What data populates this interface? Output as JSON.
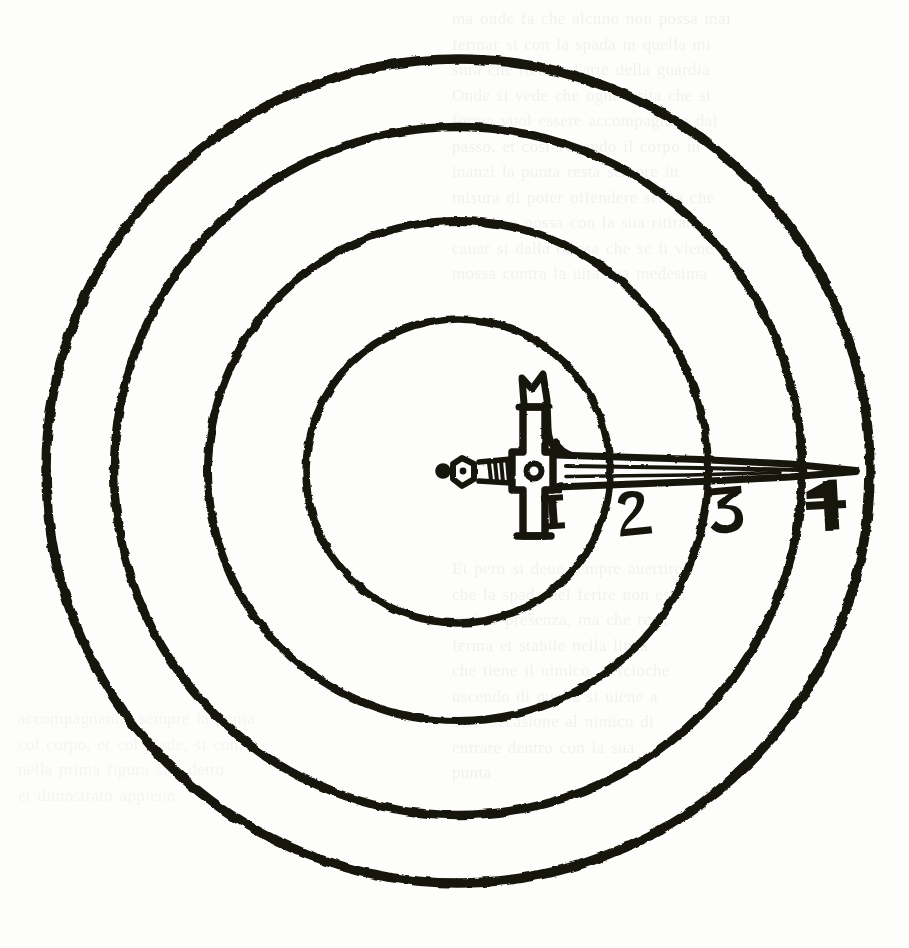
{
  "document": {
    "kind": "engraved plate",
    "caption": "Concentric measure-of-distance diagram with a cruciform sword",
    "background_color": "#fdfdfc",
    "ink_color": "#17150f"
  },
  "plate": {
    "center": {
      "x": 458,
      "y": 471
    },
    "rings": [
      {
        "id": "ring-4",
        "label": "4",
        "radius": 412,
        "stroke": 9.5
      },
      {
        "id": "ring-3",
        "label": "3",
        "radius": 344,
        "stroke": 8.5
      },
      {
        "id": "ring-2",
        "label": "2",
        "radius": 250,
        "stroke": 8.0
      },
      {
        "id": "ring-1",
        "label": "1",
        "radius": 152,
        "stroke": 7.5
      }
    ],
    "zone_numerals": [
      {
        "id": "numeral-1",
        "text": "1",
        "x": 553,
        "y": 512,
        "rotation": -4,
        "size": 40
      },
      {
        "id": "numeral-2",
        "text": "2",
        "x": 634,
        "y": 513,
        "rotation": -6,
        "size": 44
      },
      {
        "id": "numeral-3",
        "text": "3",
        "x": 727,
        "y": 509,
        "rotation": -5,
        "size": 46
      },
      {
        "id": "numeral-4",
        "text": "4",
        "x": 826,
        "y": 505,
        "rotation": -3,
        "size": 50
      }
    ],
    "sword": {
      "name": "cruciform sword",
      "pommel_x": 445,
      "guard_x": 541,
      "tip_x": 858,
      "axis_y": 471,
      "parts": [
        "pommel",
        "grip",
        "cross-guard",
        "side-hook",
        "ricasso",
        "fuller",
        "blade",
        "point"
      ]
    },
    "ghost_text": {
      "note": "illegible show-through from the reverse of the leaf",
      "block_top": "ma onde fa che alcuno non possa mai\nfermar si con la spada in quella mi\nsura che ricerca l'arte della guardia\nOnde si vede che ogni ferita che si\nforma vuol essere accompagnata dal\npasso, et cosi venendo il corpo in\ninanzi la punta resta sempre in\nmisura di poter offendere senza che\nil nimico possa con la sua ritirata\ncauar si dalla offesa che se li viene\nmossa contra la uita sua medesima",
      "block_middle": "Et pero si deue sempre auertire\nche la spada nel ferire non esca\nmai di presenza, ma che resti\nferma et stabile nella linea\nche tiene il nimico, percioche\nuscendo di quella si uiene a\ndare occasione al nimico di\nentrare dentro con la sua\npunta",
      "block_bottom": "accompagnando sempre la punta\ncol corpo, et col piede, si come\nnella prima figura si e detto\net dimostrato appieno"
    }
  }
}
